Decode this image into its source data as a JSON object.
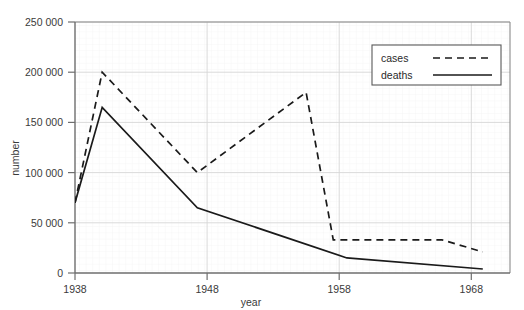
{
  "chart_data": {
    "type": "line",
    "title": "",
    "xlabel": "year",
    "ylabel": "number",
    "xlim": [
      1938,
      1970
    ],
    "ylim": [
      0,
      250000
    ],
    "xticks": [
      1938,
      1948,
      1958,
      1968
    ],
    "xtick_labels": [
      "1938",
      "1948",
      "1958",
      "1968"
    ],
    "yticks": [
      0,
      50000,
      100000,
      150000,
      200000,
      250000
    ],
    "ytick_labels": [
      "0",
      "50 000",
      "100 000",
      "150 000",
      "200 000",
      "250 000"
    ],
    "grid": true,
    "legend_position": "top-right",
    "series": [
      {
        "name": "cases",
        "style": "dashed",
        "color": "#1a1a1a",
        "x": [
          1938,
          1940,
          1947,
          1955,
          1957,
          1958,
          1965,
          1968
        ],
        "values": [
          70000,
          200000,
          100000,
          180000,
          33000,
          33000,
          33000,
          21000
        ]
      },
      {
        "name": "deaths",
        "style": "solid",
        "color": "#1a1a1a",
        "x": [
          1938,
          1940,
          1947,
          1958,
          1968
        ],
        "values": [
          70000,
          165000,
          65000,
          15000,
          4000
        ]
      }
    ]
  },
  "axes": {
    "y_axis_title": "number",
    "x_axis_title": "year"
  },
  "legend": {
    "entries": [
      {
        "label": "cases",
        "style": "dashed"
      },
      {
        "label": "deaths",
        "style": "solid"
      }
    ]
  },
  "colors": {
    "line": "#1a1a1a",
    "axis": "#6e6e6e",
    "grid_major": "#d8d8d8",
    "grid_minor": "#efefef",
    "text": "#3a3a3a",
    "background": "#ffffff"
  }
}
